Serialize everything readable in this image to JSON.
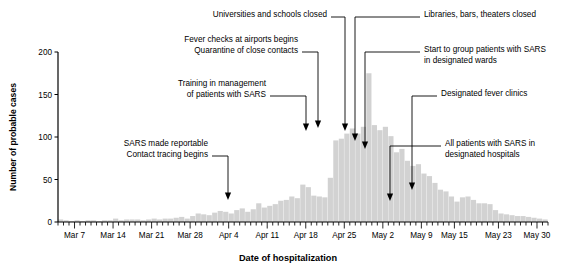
{
  "figure": {
    "y_axis_title": "Number of probable cases",
    "x_axis_title": "Date of hospitalization"
  },
  "annotations": [
    {
      "id": "universities-schools-closed",
      "lines": [
        "Universities and schools closed"
      ],
      "text_x": 327,
      "text_y": 17,
      "align": "end",
      "elbow_x": 345,
      "elbow_y": 17,
      "drop_x": 345,
      "arrow_y": 131
    },
    {
      "id": "libraries-bars-theaters-closed",
      "lines": [
        "Libraries, bars, theaters closed"
      ],
      "text_x": 424,
      "text_y": 17,
      "align": "start",
      "elbow_x": 355,
      "elbow_y": 17,
      "drop_x": 355,
      "arrow_y": 141
    },
    {
      "id": "fever-checks-quarantine",
      "lines": [
        "Fever checks at airports begins",
        "Quarantine of close contacts"
      ],
      "text_x": 298,
      "text_y": 42,
      "align": "end",
      "elbow_x": 318,
      "elbow_y": 52,
      "drop_x": 318,
      "arrow_y": 128
    },
    {
      "id": "group-patients-designated-wards",
      "lines": [
        "Start to group patients with SARS",
        "in designated wards"
      ],
      "text_x": 424,
      "text_y": 52,
      "align": "start",
      "elbow_x": 365,
      "elbow_y": 52,
      "drop_x": 365,
      "arrow_y": 149
    },
    {
      "id": "training-management-sars",
      "lines": [
        "Training in management",
        "of patients with SARS"
      ],
      "text_x": 266,
      "text_y": 86,
      "align": "end",
      "elbow_x": 306,
      "elbow_y": 96,
      "drop_x": 306,
      "arrow_y": 131
    },
    {
      "id": "designated-fever-clinics",
      "lines": [
        "Designated fever clinics"
      ],
      "text_x": 441,
      "text_y": 96,
      "align": "start",
      "elbow_x": 412,
      "elbow_y": 96,
      "drop_x": 412,
      "arrow_y": 190
    },
    {
      "id": "sars-reportable-contact-tracing",
      "lines": [
        "SARS made reportable",
        "Contact tracing begins"
      ],
      "text_x": 208,
      "text_y": 146,
      "align": "end",
      "elbow_x": 228,
      "elbow_y": 156,
      "drop_x": 228,
      "arrow_y": 200
    },
    {
      "id": "all-patients-designated-hospitals",
      "lines": [
        "All patients with SARS in",
        "designated hospitals"
      ],
      "text_x": 445,
      "text_y": 146,
      "align": "start",
      "elbow_x": 390,
      "elbow_y": 146,
      "drop_x": 390,
      "arrow_y": 201
    }
  ],
  "chart_data": {
    "type": "bar",
    "title": "",
    "xlabel": "Date of hospitalization",
    "ylabel": "Number of probable cases",
    "ylim": [
      0,
      200
    ],
    "yticks": [
      0,
      50,
      100,
      150,
      200
    ],
    "ytick_labels": [
      "0",
      "50",
      "100",
      "150",
      "200"
    ],
    "grid": false,
    "legend": null,
    "x_start": "Mar 4",
    "x_end": "May 31",
    "xtick_labels": [
      "Mar 7",
      "Mar 14",
      "Mar 21",
      "Mar 28",
      "Apr 4",
      "Apr 11",
      "Apr 18",
      "Apr 25",
      "May 2",
      "May 9",
      "May 15",
      "May 23",
      "May 30"
    ],
    "xtick_indices": [
      3,
      10,
      17,
      24,
      31,
      38,
      45,
      52,
      59,
      66,
      72,
      80,
      87
    ],
    "minor_tick_interval_days": 1,
    "categories": [
      "Mar 4",
      "Mar 5",
      "Mar 6",
      "Mar 7",
      "Mar 8",
      "Mar 9",
      "Mar 10",
      "Mar 11",
      "Mar 12",
      "Mar 13",
      "Mar 14",
      "Mar 15",
      "Mar 16",
      "Mar 17",
      "Mar 18",
      "Mar 19",
      "Mar 20",
      "Mar 21",
      "Mar 22",
      "Mar 23",
      "Mar 24",
      "Mar 25",
      "Mar 26",
      "Mar 27",
      "Mar 28",
      "Mar 29",
      "Mar 30",
      "Mar 31",
      "Apr 1",
      "Apr 2",
      "Apr 3",
      "Apr 4",
      "Apr 5",
      "Apr 6",
      "Apr 7",
      "Apr 8",
      "Apr 9",
      "Apr 10",
      "Apr 11",
      "Apr 12",
      "Apr 13",
      "Apr 14",
      "Apr 15",
      "Apr 16",
      "Apr 17",
      "Apr 18",
      "Apr 19",
      "Apr 20",
      "Apr 21",
      "Apr 22",
      "Apr 23",
      "Apr 24",
      "Apr 25",
      "Apr 26",
      "Apr 27",
      "Apr 28",
      "Apr 29",
      "Apr 30",
      "May 1",
      "May 2",
      "May 3",
      "May 4",
      "May 5",
      "May 6",
      "May 7",
      "May 8",
      "May 9",
      "May 10",
      "May 11",
      "May 12",
      "May 13",
      "May 14",
      "May 15",
      "May 16",
      "May 17",
      "May 18",
      "May 19",
      "May 20",
      "May 21",
      "May 22",
      "May 23",
      "May 24",
      "May 25",
      "May 26",
      "May 27",
      "May 28",
      "May 29",
      "May 30",
      "May 31"
    ],
    "values": [
      3,
      2,
      1,
      2,
      1,
      2,
      2,
      1,
      2,
      2,
      4,
      2,
      3,
      3,
      3,
      2,
      3,
      4,
      3,
      4,
      4,
      5,
      6,
      4,
      7,
      10,
      9,
      8,
      11,
      13,
      12,
      10,
      14,
      16,
      12,
      15,
      22,
      17,
      19,
      21,
      25,
      26,
      30,
      28,
      44,
      41,
      31,
      30,
      29,
      52,
      96,
      98,
      104,
      110,
      104,
      112,
      175,
      114,
      108,
      112,
      101,
      82,
      86,
      72,
      66,
      68,
      57,
      54,
      46,
      38,
      36,
      30,
      24,
      29,
      30,
      26,
      22,
      22,
      21,
      14,
      10,
      9,
      8,
      7,
      7,
      6,
      5,
      4,
      3
    ],
    "bar_color": "#d2d2d2",
    "axis_color": "#000000"
  }
}
